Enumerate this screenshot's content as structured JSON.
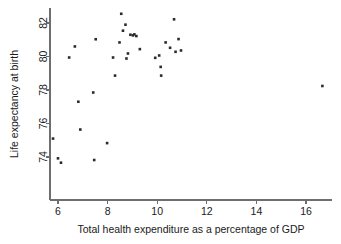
{
  "chart_data": {
    "type": "scatter",
    "title": "",
    "xlabel": "Total health expenditure as a percentage of GDP",
    "ylabel": "Life expectancy at birth",
    "xlim": [
      5.4,
      17.2
    ],
    "ylim": [
      73.2,
      83.0
    ],
    "xticks": [
      6,
      8,
      10,
      12,
      14,
      16
    ],
    "xticklabels": [
      "6",
      "8",
      "10",
      "12",
      "14",
      "16"
    ],
    "yticks": [
      74,
      76,
      78,
      80,
      82
    ],
    "yticklabels": [
      "74",
      "76",
      "78",
      "80",
      "82"
    ],
    "grid": false,
    "legend": null,
    "marker": "filled-square",
    "marker_color": "#2b2b2b",
    "points": [
      {
        "x": 5.8,
        "y": 75.1
      },
      {
        "x": 6.0,
        "y": 73.92
      },
      {
        "x": 6.12,
        "y": 73.66
      },
      {
        "x": 6.45,
        "y": 79.94
      },
      {
        "x": 6.68,
        "y": 80.6
      },
      {
        "x": 6.82,
        "y": 77.3
      },
      {
        "x": 6.9,
        "y": 75.64
      },
      {
        "x": 7.42,
        "y": 77.85
      },
      {
        "x": 7.46,
        "y": 73.82
      },
      {
        "x": 7.52,
        "y": 81.03
      },
      {
        "x": 7.98,
        "y": 74.83
      },
      {
        "x": 8.22,
        "y": 79.94
      },
      {
        "x": 8.3,
        "y": 78.86
      },
      {
        "x": 8.48,
        "y": 80.84
      },
      {
        "x": 8.55,
        "y": 82.55
      },
      {
        "x": 8.62,
        "y": 81.54
      },
      {
        "x": 8.72,
        "y": 81.9
      },
      {
        "x": 8.76,
        "y": 79.88
      },
      {
        "x": 8.82,
        "y": 80.18
      },
      {
        "x": 8.92,
        "y": 81.3
      },
      {
        "x": 9.02,
        "y": 81.26
      },
      {
        "x": 9.08,
        "y": 81.32
      },
      {
        "x": 9.16,
        "y": 81.22
      },
      {
        "x": 9.3,
        "y": 80.44
      },
      {
        "x": 9.92,
        "y": 79.92
      },
      {
        "x": 10.08,
        "y": 80.06
      },
      {
        "x": 10.14,
        "y": 79.38
      },
      {
        "x": 10.16,
        "y": 78.86
      },
      {
        "x": 10.34,
        "y": 80.84
      },
      {
        "x": 10.52,
        "y": 80.52
      },
      {
        "x": 10.68,
        "y": 82.22
      },
      {
        "x": 10.74,
        "y": 80.28
      },
      {
        "x": 10.86,
        "y": 81.04
      },
      {
        "x": 10.96,
        "y": 80.36
      },
      {
        "x": 16.66,
        "y": 78.24
      }
    ]
  }
}
